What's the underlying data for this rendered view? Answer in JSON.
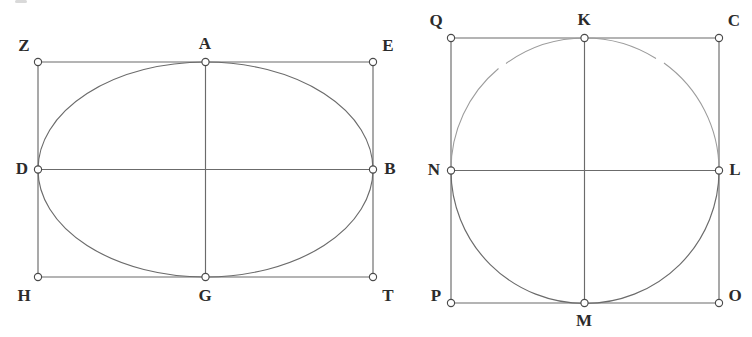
{
  "page": {
    "background_color": "#ffffff",
    "line_color": "#6b6b6b",
    "label_color": "#2b2b2b",
    "marker_fill": "#ffffff",
    "width": 752,
    "height": 337
  },
  "figures": [
    {
      "id": "left-figure",
      "name": "ellipse-in-rectangle",
      "caption": "",
      "shape_type": "ellipse",
      "center": {
        "x": 205.5,
        "y": 169.5
      },
      "radius_x": 167.5,
      "radius_y": 107.5,
      "rectangle": {
        "left": 38,
        "top": 62,
        "right": 373,
        "bottom": 277
      },
      "axes": {
        "vertical": {
          "x1": 205.5,
          "y1": 62,
          "x2": 205.5,
          "y2": 277
        },
        "horizontal": {
          "x1": 38,
          "y1": 169.5,
          "x2": 373,
          "y2": 169.5
        }
      },
      "points": [
        {
          "label": "Z",
          "x": 38,
          "y": 62,
          "label_x": 24,
          "label_y": 47,
          "role": "rectangle-corner-top-left"
        },
        {
          "label": "A",
          "x": 205.5,
          "y": 62,
          "label_x": 205,
          "label_y": 45,
          "role": "ellipse-top-vertex"
        },
        {
          "label": "E",
          "x": 373,
          "y": 62,
          "label_x": 388,
          "label_y": 47,
          "role": "rectangle-corner-top-right"
        },
        {
          "label": "D",
          "x": 38,
          "y": 169.5,
          "label_x": 22,
          "label_y": 170,
          "role": "ellipse-left-vertex"
        },
        {
          "label": "B",
          "x": 373,
          "y": 169.5,
          "label_x": 390,
          "label_y": 170,
          "role": "ellipse-right-vertex"
        },
        {
          "label": "H",
          "x": 38,
          "y": 277,
          "label_x": 24,
          "label_y": 297,
          "role": "rectangle-corner-bottom-left"
        },
        {
          "label": "G",
          "x": 205.5,
          "y": 277,
          "label_x": 205,
          "label_y": 297,
          "role": "ellipse-bottom-vertex"
        },
        {
          "label": "T",
          "x": 373,
          "y": 277,
          "label_x": 388,
          "label_y": 297,
          "role": "rectangle-corner-bottom-right"
        }
      ]
    },
    {
      "id": "right-figure",
      "name": "circle-in-square",
      "caption": "",
      "shape_type": "circle",
      "center": {
        "x": 584.5,
        "y": 170.5
      },
      "radius": 133.5,
      "rectangle": {
        "left": 451,
        "top": 38,
        "right": 719,
        "bottom": 303
      },
      "axes": {
        "vertical": {
          "x1": 584.5,
          "y1": 38,
          "x2": 584.5,
          "y2": 303
        },
        "horizontal": {
          "x1": 451,
          "y1": 170.5,
          "x2": 719,
          "y2": 170.5
        }
      },
      "points": [
        {
          "label": "Q",
          "x": 451,
          "y": 38,
          "label_x": 436,
          "label_y": 22,
          "role": "square-corner-top-left"
        },
        {
          "label": "K",
          "x": 584.5,
          "y": 38,
          "label_x": 584,
          "label_y": 21,
          "role": "circle-top-vertex"
        },
        {
          "label": "C",
          "x": 719,
          "y": 38,
          "label_x": 734,
          "label_y": 22,
          "role": "square-corner-top-right"
        },
        {
          "label": "N",
          "x": 451,
          "y": 170.5,
          "label_x": 434,
          "label_y": 171,
          "role": "circle-left-vertex"
        },
        {
          "label": "L",
          "x": 719,
          "y": 170.5,
          "label_x": 735,
          "label_y": 171,
          "role": "circle-right-vertex"
        },
        {
          "label": "P",
          "x": 451,
          "y": 303,
          "label_x": 436,
          "label_y": 297,
          "role": "square-corner-bottom-left"
        },
        {
          "label": "M",
          "x": 584.5,
          "y": 303,
          "label_x": 584,
          "label_y": 322,
          "role": "circle-bottom-vertex"
        },
        {
          "label": "O",
          "x": 719,
          "y": 303,
          "label_x": 735,
          "label_y": 297,
          "role": "square-corner-bottom-right"
        }
      ]
    }
  ]
}
